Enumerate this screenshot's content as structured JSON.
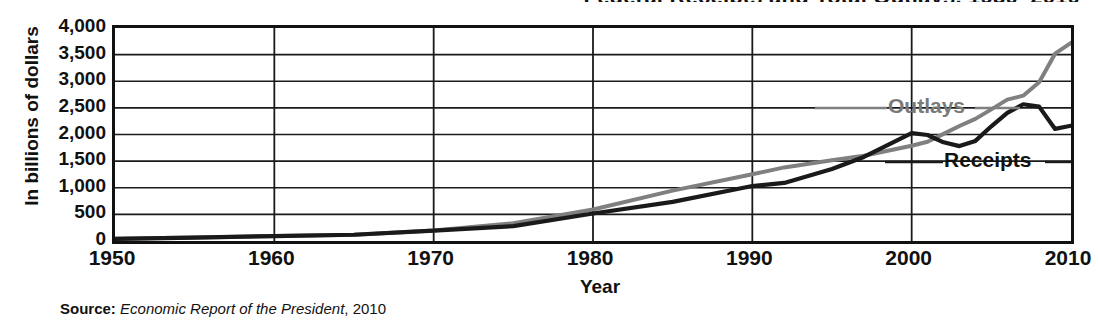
{
  "figure": {
    "title": "Federal Receipts and Total Outlays, 1950–2010",
    "ylabel": "In billions of dollars",
    "xlabel": "Year",
    "source_prefix": "Source:",
    "source_work": "Economic Report of the President",
    "source_year": ", 2010"
  },
  "colors": {
    "outlays": "#808080",
    "receipts": "#1a1a1a",
    "frame": "#111111",
    "grid": "#1a1a1a",
    "background": "#ffffff"
  },
  "annotations": {
    "outlays": "Outlays",
    "receipts": "Receipts"
  },
  "axes": {
    "y_ticks": [
      "4,000",
      "3,500",
      "3,000",
      "2,500",
      "2,000",
      "1,500",
      "1,000",
      "500",
      "0"
    ],
    "x_ticks": [
      "1950",
      "1960",
      "1970",
      "1980",
      "1990",
      "2000",
      "2010"
    ]
  },
  "chart_data": {
    "type": "line",
    "title": "Federal Receipts and Total Outlays, 1950–2010",
    "xlabel": "Year",
    "ylabel": "In billions of dollars",
    "xlim": [
      1950,
      2010
    ],
    "ylim": [
      0,
      4000
    ],
    "ytick_values": [
      0,
      500,
      1000,
      1500,
      2000,
      2500,
      3000,
      3500,
      4000
    ],
    "xtick_values": [
      1950,
      1960,
      1970,
      1980,
      1990,
      2000,
      2010
    ],
    "grid": "horizontal-and-vertical",
    "legend": "inline-annotations",
    "source": "Economic Report of the President, 2010",
    "x": [
      1950,
      1955,
      1960,
      1965,
      1970,
      1975,
      1980,
      1985,
      1990,
      1992,
      1995,
      1997,
      2000,
      2001,
      2002,
      2003,
      2004,
      2005,
      2006,
      2007,
      2008,
      2009,
      2010
    ],
    "series": [
      {
        "name": "Outlays",
        "color": "#808080",
        "values": [
          43,
          68,
          92,
          118,
          196,
          332,
          591,
          946,
          1253,
          1382,
          1516,
          1601,
          1789,
          1863,
          2011,
          2160,
          2293,
          2472,
          2655,
          2729,
          2983,
          3518,
          3721
        ]
      },
      {
        "name": "Receipts",
        "color": "#1a1a1a",
        "values": [
          39,
          65,
          92,
          117,
          193,
          279,
          517,
          734,
          1032,
          1091,
          1352,
          1579,
          2025,
          1991,
          1853,
          1782,
          1880,
          2154,
          2407,
          2568,
          2524,
          2105,
          2165
        ]
      }
    ]
  }
}
